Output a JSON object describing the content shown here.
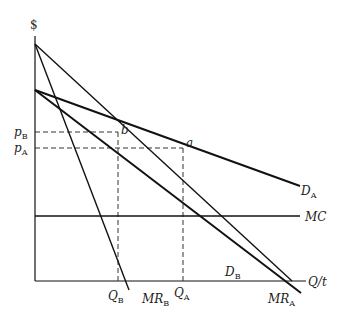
{
  "diagram": {
    "type": "economics-price-discrimination",
    "axes": {
      "y_label": "$",
      "x_label": "Q/t"
    },
    "curves": [
      {
        "id": "DA",
        "label": "D",
        "sub": "A"
      },
      {
        "id": "DB",
        "label": "D",
        "sub": "B"
      },
      {
        "id": "MRA",
        "label": "MR",
        "sub": "A"
      },
      {
        "id": "MRB",
        "label": "MR",
        "sub": "B"
      },
      {
        "id": "MC",
        "label": "MC",
        "sub": ""
      }
    ],
    "prices": [
      {
        "label": "p",
        "sub": "B"
      },
      {
        "label": "p",
        "sub": "A"
      }
    ],
    "quantities": [
      {
        "label": "Q",
        "sub": "B"
      },
      {
        "label": "Q",
        "sub": "A"
      }
    ],
    "points": [
      {
        "label": "a"
      },
      {
        "label": "b"
      }
    ],
    "colors": {
      "line": "#111111",
      "background": "#ffffff"
    }
  }
}
